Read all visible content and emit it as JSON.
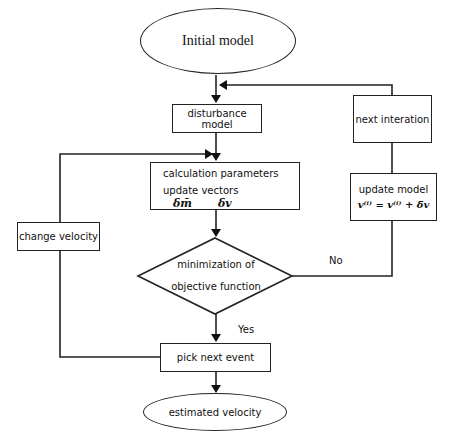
{
  "flowchart": {
    "start": {
      "label": "Initial model"
    },
    "disturbance": {
      "label": "disturbance model"
    },
    "next_iteration": {
      "label": "next interation"
    },
    "calculation": {
      "line1": "calculation parameters",
      "line2": "update vectors",
      "symbol_m": "δm̄",
      "symbol_v": "δv"
    },
    "update_model": {
      "label": "update model",
      "formula": "v⁽ⁱ⁾ = v⁽ⁱ⁾ + δ̄v"
    },
    "change_velocity": {
      "label": "change velocity"
    },
    "decision": {
      "line1": "minimization of",
      "line2": "objective function",
      "no_label": "No",
      "yes_label": "Yes"
    },
    "pick_next": {
      "label": "pick next event"
    },
    "end": {
      "label": "estimated velocity"
    }
  },
  "colors": {
    "stroke": "#222222",
    "background": "#ffffff"
  }
}
